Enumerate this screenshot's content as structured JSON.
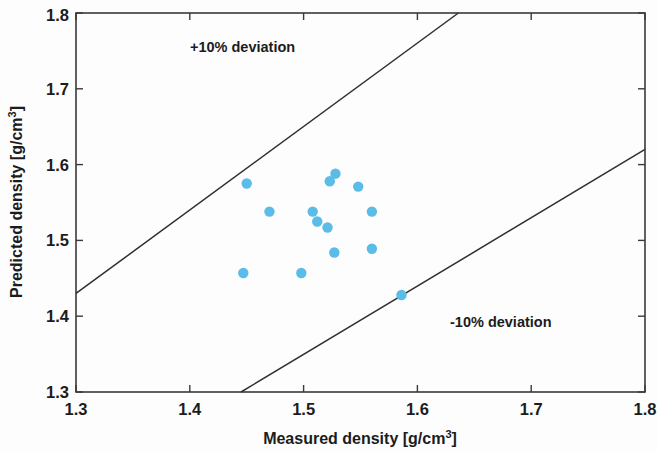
{
  "chart_data": {
    "type": "scatter",
    "title": "",
    "xlabel": "Measured density [g/cm3]",
    "xlabel_base": "Measured density [g/cm",
    "xlabel_sup": "3",
    "xlabel_tail": "]",
    "ylabel": "Predicted density [g/cm3]",
    "ylabel_base": "Predicted density [g/cm",
    "ylabel_sup": "3",
    "ylabel_tail": "]",
    "xlim": [
      1.3,
      1.8
    ],
    "ylim": [
      1.3,
      1.8
    ],
    "xticks": [
      "1.3",
      "1.4",
      "1.5",
      "1.6",
      "1.7",
      "1.8"
    ],
    "yticks": [
      "1.3",
      "1.4",
      "1.5",
      "1.6",
      "1.7",
      "1.8"
    ],
    "xtick_values": [
      1.3,
      1.4,
      1.5,
      1.6,
      1.7,
      1.8
    ],
    "ytick_values": [
      1.3,
      1.4,
      1.5,
      1.6,
      1.7,
      1.8
    ],
    "grid": false,
    "legend": "none",
    "marker_color": "#5BBCE8",
    "marker_size": 5.2,
    "line_color": "#2e2e2e",
    "x": [
      1.47,
      1.45,
      1.523,
      1.528,
      1.548,
      1.508,
      1.512,
      1.521,
      1.56,
      1.527,
      1.56,
      1.447,
      1.498,
      1.586
    ],
    "y": [
      1.538,
      1.575,
      1.578,
      1.588,
      1.571,
      1.538,
      1.525,
      1.517,
      1.538,
      1.484,
      1.489,
      1.457,
      1.457,
      1.428
    ],
    "points": [
      {
        "x": 1.47,
        "y": 1.538
      },
      {
        "x": 1.45,
        "y": 1.575
      },
      {
        "x": 1.523,
        "y": 1.578
      },
      {
        "x": 1.528,
        "y": 1.588
      },
      {
        "x": 1.548,
        "y": 1.571
      },
      {
        "x": 1.508,
        "y": 1.538
      },
      {
        "x": 1.512,
        "y": 1.525
      },
      {
        "x": 1.521,
        "y": 1.517
      },
      {
        "x": 1.56,
        "y": 1.538
      },
      {
        "x": 1.527,
        "y": 1.484
      },
      {
        "x": 1.56,
        "y": 1.489
      },
      {
        "x": 1.447,
        "y": 1.457
      },
      {
        "x": 1.498,
        "y": 1.457
      },
      {
        "x": 1.586,
        "y": 1.428
      }
    ],
    "reference_lines": [
      {
        "name": "+10% deviation",
        "label": "+10% deviation",
        "slope": 1.1,
        "intercept": 0,
        "from": {
          "x": 1.3,
          "y": 1.43
        },
        "to": {
          "x": 1.636,
          "y": 1.8
        },
        "label_position": {
          "x": 1.4,
          "y": 1.74
        }
      },
      {
        "name": "-10% deviation",
        "label": "-10% deviation",
        "slope": 0.9,
        "intercept": 0,
        "from": {
          "x": 1.445,
          "y": 1.3
        },
        "to": {
          "x": 1.8,
          "y": 1.62
        },
        "label_position": {
          "x": 1.66,
          "y": 1.39
        }
      }
    ],
    "annotations": [
      {
        "text": "+10% deviation",
        "x": 1.4,
        "y": 1.74
      },
      {
        "text": "-10% deviation",
        "x": 1.66,
        "y": 1.39
      }
    ]
  },
  "axes": {
    "x_title_base": "Measured density [g/cm",
    "x_title_sup": "3",
    "x_title_tail": "]",
    "y_title_base": "Predicted density [g/cm",
    "y_title_sup": "3",
    "y_title_tail": "]"
  },
  "labels": {
    "dev_plus": "+10% deviation",
    "dev_minus": "-10% deviation",
    "x0": "1.3",
    "x1": "1.4",
    "x2": "1.5",
    "x3": "1.6",
    "x4": "1.7",
    "x5": "1.8",
    "y0": "1.3",
    "y1": "1.4",
    "y2": "1.5",
    "y3": "1.6",
    "y4": "1.7",
    "y5": "1.8"
  }
}
